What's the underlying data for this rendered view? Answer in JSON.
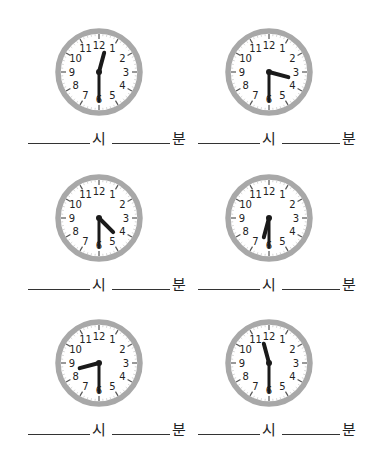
{
  "worksheet": {
    "hour_unit": "시",
    "minute_unit": "분",
    "clock_numbers": [
      "12",
      "1",
      "2",
      "3",
      "4",
      "5",
      "6",
      "7",
      "8",
      "9",
      "10",
      "11"
    ],
    "colors": {
      "rim": "#a8a8a8",
      "hands": "#1a1a1a",
      "face": "#ffffff",
      "text": "#222222"
    },
    "clocks": [
      {
        "hour": 12,
        "minute": 30
      },
      {
        "hour": 3,
        "minute": 30
      },
      {
        "hour": 4,
        "minute": 30
      },
      {
        "hour": 6,
        "minute": 30
      },
      {
        "hour": 8,
        "minute": 30
      },
      {
        "hour": 11,
        "minute": 30
      }
    ]
  }
}
